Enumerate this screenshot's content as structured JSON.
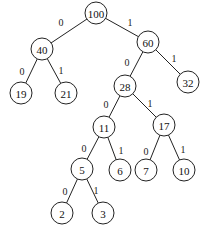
{
  "diagram": {
    "type": "huffman-tree",
    "nodes": [
      {
        "id": "n100",
        "label": "100",
        "x": 96,
        "y": 13
      },
      {
        "id": "n40",
        "label": "40",
        "x": 42,
        "y": 49
      },
      {
        "id": "n60",
        "label": "60",
        "x": 148,
        "y": 42
      },
      {
        "id": "n19",
        "label": "19",
        "x": 21,
        "y": 93
      },
      {
        "id": "n21",
        "label": "21",
        "x": 66,
        "y": 93
      },
      {
        "id": "n28",
        "label": "28",
        "x": 125,
        "y": 86
      },
      {
        "id": "n32",
        "label": "32",
        "x": 188,
        "y": 82
      },
      {
        "id": "n11",
        "label": "11",
        "x": 104,
        "y": 127
      },
      {
        "id": "n17",
        "label": "17",
        "x": 164,
        "y": 125
      },
      {
        "id": "n5",
        "label": "5",
        "x": 82,
        "y": 169
      },
      {
        "id": "n6",
        "label": "6",
        "x": 120,
        "y": 170
      },
      {
        "id": "n7",
        "label": "7",
        "x": 146,
        "y": 170
      },
      {
        "id": "n10",
        "label": "10",
        "x": 184,
        "y": 170
      },
      {
        "id": "n2",
        "label": "2",
        "x": 62,
        "y": 213
      },
      {
        "id": "n3",
        "label": "3",
        "x": 103,
        "y": 213
      }
    ],
    "edges": [
      {
        "from": "n100",
        "to": "n40",
        "label": "0",
        "lx": 61,
        "ly": 22
      },
      {
        "from": "n100",
        "to": "n60",
        "label": "1",
        "lx": 130,
        "ly": 22
      },
      {
        "from": "n40",
        "to": "n19",
        "label": "0",
        "lx": 22,
        "ly": 71
      },
      {
        "from": "n40",
        "to": "n21",
        "label": "1",
        "lx": 61,
        "ly": 70
      },
      {
        "from": "n60",
        "to": "n28",
        "label": "0",
        "lx": 127,
        "ly": 62
      },
      {
        "from": "n60",
        "to": "n32",
        "label": "1",
        "lx": 174,
        "ly": 58
      },
      {
        "from": "n28",
        "to": "n11",
        "label": "0",
        "lx": 106,
        "ly": 104
      },
      {
        "from": "n28",
        "to": "n17",
        "label": "1",
        "lx": 150,
        "ly": 103
      },
      {
        "from": "n11",
        "to": "n5",
        "label": "0",
        "lx": 84,
        "ly": 148
      },
      {
        "from": "n11",
        "to": "n6",
        "label": "1",
        "lx": 121,
        "ly": 150
      },
      {
        "from": "n17",
        "to": "n7",
        "label": "0",
        "lx": 146,
        "ly": 151
      },
      {
        "from": "n17",
        "to": "n10",
        "label": "1",
        "lx": 183,
        "ly": 149
      },
      {
        "from": "n5",
        "to": "n2",
        "label": "0",
        "lx": 65,
        "ly": 191
      },
      {
        "from": "n5",
        "to": "n3",
        "label": "1",
        "lx": 96,
        "ly": 190
      }
    ],
    "node_radius": 11,
    "colors": {
      "stroke": "#222222",
      "fill": "#ffffff",
      "text": "#111111"
    }
  }
}
